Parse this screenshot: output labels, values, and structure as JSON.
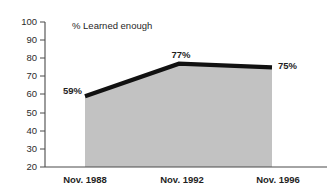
{
  "chart_data": {
    "type": "area",
    "title": "% Learned enough",
    "xlabel": "",
    "ylabel": "",
    "categories": [
      "Nov. 1988",
      "Nov. 1992",
      "Nov. 1996"
    ],
    "values": [
      59,
      77,
      75
    ],
    "point_labels": [
      "59%",
      "77%",
      "75%"
    ],
    "ylim": [
      20,
      100
    ],
    "yticks": [
      20,
      30,
      40,
      50,
      60,
      70,
      80,
      90,
      100
    ],
    "ytick_labels": [
      "20",
      "30",
      "40",
      "50",
      "60",
      "70",
      "80",
      "90",
      "100"
    ],
    "grid": false,
    "legend": "none",
    "series": [
      {
        "name": "% Learned enough",
        "values": [
          59,
          77,
          75
        ]
      }
    ],
    "colors": {
      "line": "#111111",
      "fill": "#c2c2c2",
      "axis": "#4a4a4a",
      "text": "#1f1f1f",
      "background": "#ffffff"
    }
  }
}
